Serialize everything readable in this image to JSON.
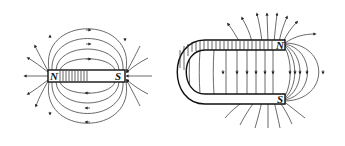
{
  "diagram": {
    "bar_magnet": {
      "label_north": "N",
      "label_south": "S",
      "field_direction": "out of N, into S"
    },
    "horseshoe_magnet": {
      "label_north": "N",
      "label_south": "S",
      "field_direction": "from N (top arm) to S (bottom arm)"
    },
    "colors": {
      "line": "#444444",
      "magnet_outline": "#111111",
      "background": "#ffffff"
    }
  }
}
